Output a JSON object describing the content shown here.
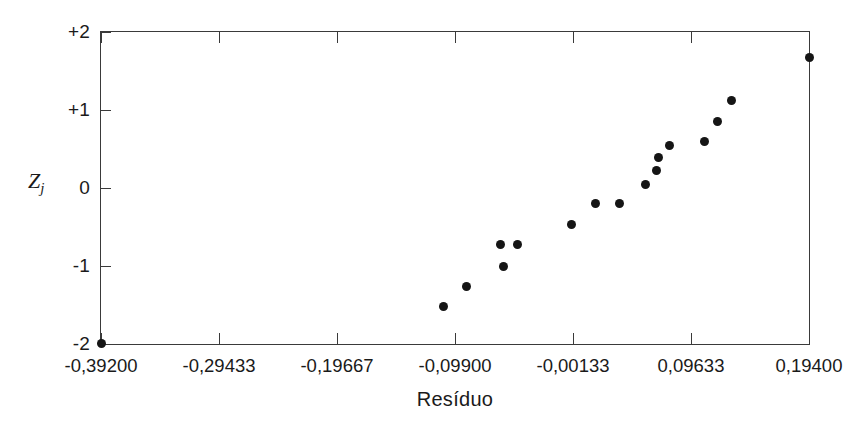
{
  "figure": {
    "background": "#ffffff",
    "foreground": "#1a1a1a",
    "point_color": "#151515",
    "axis_color": "#3a3a3a",
    "width": 864,
    "height": 428
  },
  "axes": {
    "x_title": "Resíduo",
    "y_title_base": "Z",
    "y_title_sub": "j",
    "x_ticklabels": [
      "-0,39200",
      "-0,29433",
      "-0,19667",
      "-0,09900",
      "-0,00133",
      "0,09633",
      "0,19400"
    ],
    "x_tickvalues": [
      -0.392,
      -0.29433,
      -0.19667,
      -0.099,
      -0.00133,
      0.09633,
      0.194
    ],
    "y_ticklabels": [
      "+2",
      "+1",
      "0",
      "-1",
      "-2"
    ],
    "y_tickvalues": [
      2,
      1,
      0,
      -1,
      -2
    ]
  },
  "chart_data": {
    "type": "scatter",
    "title": "",
    "subtitle": "",
    "xlabel": "Resíduo",
    "ylabel": "Zj",
    "xlim": [
      -0.392,
      0.194
    ],
    "ylim": [
      -2,
      2
    ],
    "grid": false,
    "legend": null,
    "x_ticks": [
      -0.392,
      -0.29433,
      -0.19667,
      -0.099,
      -0.00133,
      0.09633,
      0.194
    ],
    "x_tick_labels": [
      "-0,39200",
      "-0,29433",
      "-0,19667",
      "-0,09900",
      "-0,00133",
      "0,09633",
      "0,19400"
    ],
    "y_ticks": [
      2,
      1,
      0,
      -1,
      -2
    ],
    "y_tick_labels": [
      "+2",
      "+1",
      "0",
      "-1",
      "-2"
    ],
    "marker": "filled-circle",
    "marker_size": 9,
    "n_points": 17,
    "points": [
      {
        "x": -0.392,
        "y": -1.99
      },
      {
        "x": -0.1087,
        "y": -1.52
      },
      {
        "x": -0.0892,
        "y": -1.26
      },
      {
        "x": -0.0612,
        "y": -0.73
      },
      {
        "x": -0.0586,
        "y": -1.01
      },
      {
        "x": -0.0476,
        "y": -0.73
      },
      {
        "x": -0.0027,
        "y": -0.47
      },
      {
        "x": 0.0177,
        "y": -0.2
      },
      {
        "x": 0.0372,
        "y": -0.2
      },
      {
        "x": 0.0584,
        "y": 0.04
      },
      {
        "x": 0.0678,
        "y": 0.23
      },
      {
        "x": 0.0695,
        "y": 0.39
      },
      {
        "x": 0.0788,
        "y": 0.55
      },
      {
        "x": 0.1179,
        "y": 0.85
      },
      {
        "x": 0.1298,
        "y": 1.12
      },
      {
        "x": 0.1077,
        "y": 0.6
      },
      {
        "x": 0.194,
        "y": 1.67
      }
    ],
    "series": [
      {
        "name": "residuals",
        "x": [
          -0.392,
          -0.1087,
          -0.0892,
          -0.0612,
          -0.0586,
          -0.0476,
          -0.0027,
          0.0177,
          0.0372,
          0.0584,
          0.0678,
          0.0695,
          0.0788,
          0.1077,
          0.1179,
          0.1298,
          0.194
        ],
        "y": [
          -1.99,
          -1.52,
          -1.26,
          -0.73,
          -1.01,
          -0.73,
          -0.47,
          -0.2,
          -0.2,
          0.04,
          0.23,
          0.39,
          0.55,
          0.6,
          0.85,
          1.12,
          1.67
        ]
      }
    ]
  }
}
